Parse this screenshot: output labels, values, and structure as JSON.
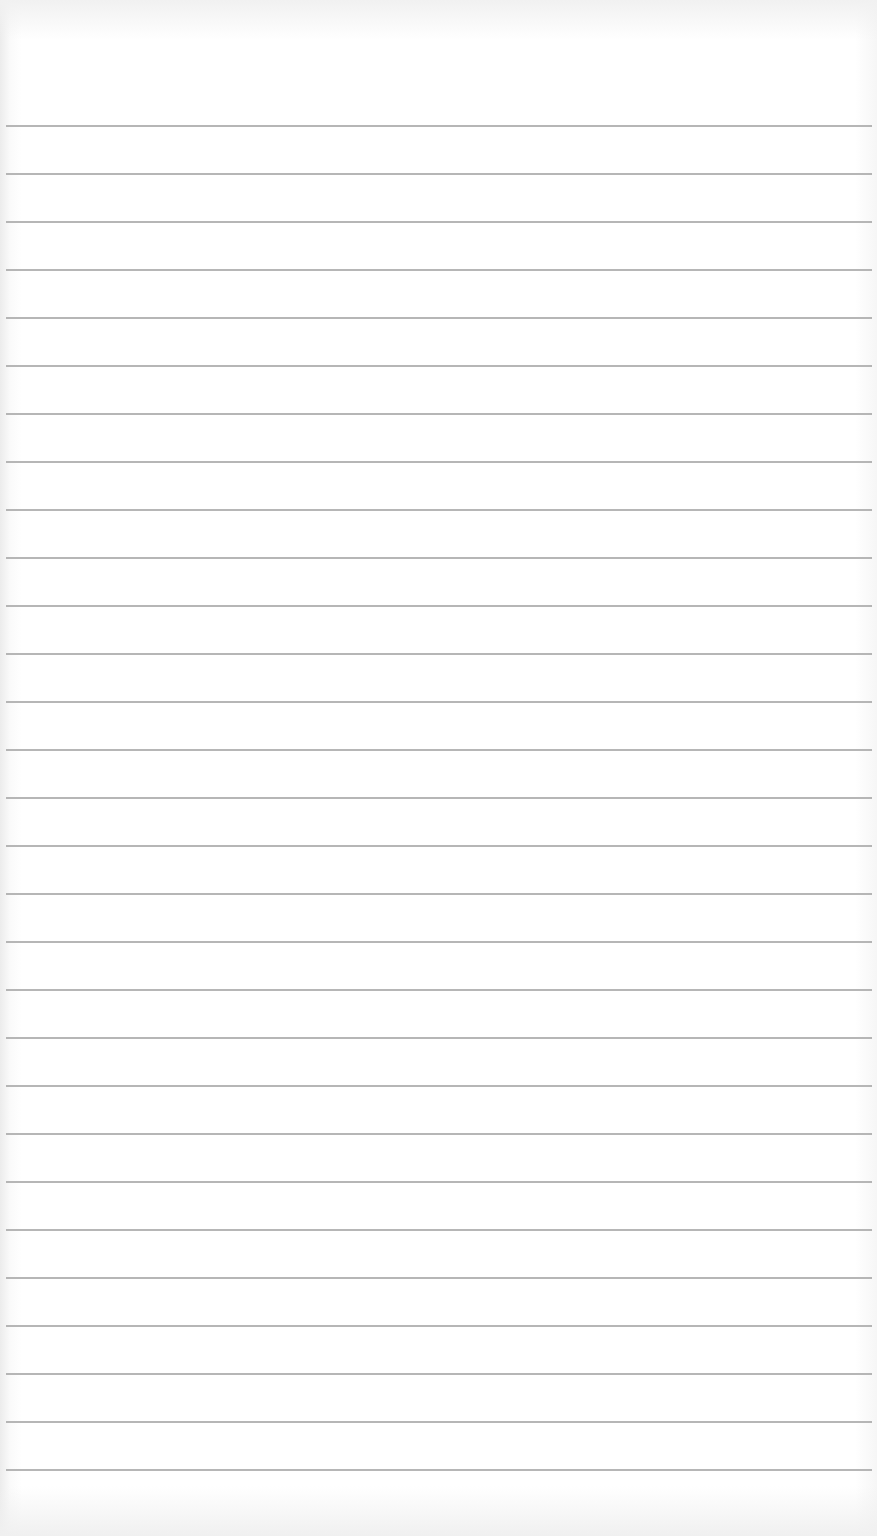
{
  "paper": {
    "type": "lined-notepad-page",
    "line_count": 29,
    "first_line_y": 126,
    "line_spacing": 48,
    "line_color": "#a9a9a9",
    "background_color": "#ffffff"
  }
}
